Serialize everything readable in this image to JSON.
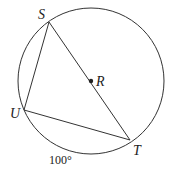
{
  "diagram": {
    "type": "circle-geometry",
    "circle": {
      "center": "R",
      "cx": 91,
      "cy": 81,
      "r": 73
    },
    "points": {
      "S": {
        "label": "S",
        "x": 49,
        "y": 22
      },
      "U": {
        "label": "U",
        "x": 24,
        "y": 110
      },
      "T": {
        "label": "T",
        "x": 130,
        "y": 140
      },
      "R": {
        "label": "R",
        "x": 91,
        "y": 81
      }
    },
    "segments": [
      "SU",
      "UT",
      "ST"
    ],
    "arc_label": {
      "arc": "UT",
      "text": "100°"
    },
    "stroke_color": "#333333"
  }
}
